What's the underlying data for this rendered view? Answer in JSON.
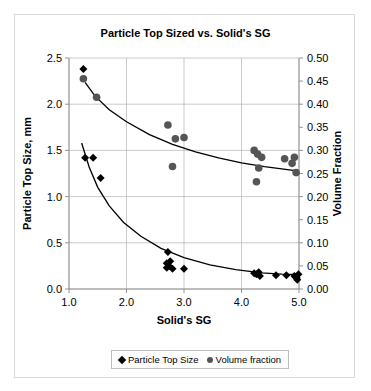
{
  "chart_data": {
    "type": "scatter",
    "title": "Particle Top Sized vs. Solid's SG",
    "xlabel": "Solid's SG",
    "ylabel": "Particle Top Size, mm",
    "y2label": "Volume Fraction",
    "xlim": [
      1.0,
      5.0
    ],
    "ylim": [
      0.0,
      2.5
    ],
    "y2lim": [
      0.0,
      0.5
    ],
    "xticks": [
      "1.0",
      "2.0",
      "3.0",
      "4.0",
      "5.0"
    ],
    "xtick_values": [
      1.0,
      2.0,
      3.0,
      4.0,
      5.0
    ],
    "yticks": [
      "0.0",
      "0.5",
      "1.0",
      "1.5",
      "2.0",
      "2.5"
    ],
    "ytick_values": [
      0.0,
      0.5,
      1.0,
      1.5,
      2.0,
      2.5
    ],
    "y2ticks": [
      "0.00",
      "0.05",
      "0.10",
      "0.15",
      "0.20",
      "0.25",
      "0.30",
      "0.35",
      "0.40",
      "0.45",
      "0.50"
    ],
    "y2tick_values": [
      0.0,
      0.05,
      0.1,
      0.15,
      0.2,
      0.25,
      0.3,
      0.35,
      0.4,
      0.45,
      0.5
    ],
    "grid": true,
    "legend_position": "bottom",
    "colors": {
      "particle_marker": "#000000",
      "volume_marker": "#555555",
      "trend_line": "#000000",
      "grid_line": "#b5b5b5",
      "frame": "#d8d8d8"
    },
    "series": [
      {
        "name": "Particle Top Size",
        "marker": "diamond",
        "color": "#000000",
        "axis": "left",
        "points": [
          [
            1.25,
            2.38
          ],
          [
            1.28,
            1.42
          ],
          [
            1.42,
            1.42
          ],
          [
            1.55,
            1.2
          ],
          [
            2.72,
            0.4
          ],
          [
            2.7,
            0.28
          ],
          [
            2.74,
            0.25
          ],
          [
            2.76,
            0.3
          ],
          [
            2.7,
            0.23
          ],
          [
            2.8,
            0.22
          ],
          [
            3.0,
            0.22
          ],
          [
            4.22,
            0.17
          ],
          [
            4.26,
            0.16
          ],
          [
            4.3,
            0.18
          ],
          [
            4.32,
            0.14
          ],
          [
            4.6,
            0.15
          ],
          [
            4.78,
            0.15
          ],
          [
            4.92,
            0.14
          ],
          [
            4.96,
            0.12
          ],
          [
            4.99,
            0.16
          ],
          [
            4.97,
            0.1
          ]
        ]
      },
      {
        "name": "Volume fraction",
        "marker": "circle",
        "color": "#555555",
        "axis": "right",
        "points": [
          [
            1.25,
            0.455
          ],
          [
            1.48,
            0.415
          ],
          [
            2.72,
            0.355
          ],
          [
            2.85,
            0.325
          ],
          [
            3.0,
            0.328
          ],
          [
            2.8,
            0.265
          ],
          [
            4.22,
            0.3
          ],
          [
            4.28,
            0.292
          ],
          [
            4.35,
            0.285
          ],
          [
            4.3,
            0.262
          ],
          [
            4.26,
            0.232
          ],
          [
            4.75,
            0.282
          ],
          [
            4.92,
            0.285
          ],
          [
            4.88,
            0.272
          ],
          [
            4.95,
            0.252
          ]
        ]
      }
    ],
    "trend_lines": [
      {
        "name": "volume-fraction-trend",
        "axis": "right",
        "points": [
          [
            1.28,
            0.447
          ],
          [
            1.45,
            0.418
          ],
          [
            1.7,
            0.388
          ],
          [
            2.0,
            0.362
          ],
          [
            2.4,
            0.334
          ],
          [
            2.8,
            0.313
          ],
          [
            3.2,
            0.297
          ],
          [
            3.6,
            0.284
          ],
          [
            4.0,
            0.273
          ],
          [
            4.4,
            0.265
          ],
          [
            4.7,
            0.26
          ],
          [
            5.0,
            0.255
          ]
        ]
      },
      {
        "name": "particle-top-size-trend",
        "axis": "left",
        "points": [
          [
            1.22,
            1.58
          ],
          [
            1.35,
            1.32
          ],
          [
            1.5,
            1.1
          ],
          [
            1.7,
            0.9
          ],
          [
            1.95,
            0.72
          ],
          [
            2.25,
            0.57
          ],
          [
            2.6,
            0.44
          ],
          [
            3.0,
            0.34
          ],
          [
            3.45,
            0.26
          ],
          [
            3.9,
            0.21
          ],
          [
            4.35,
            0.175
          ],
          [
            4.7,
            0.16
          ],
          [
            5.0,
            0.155
          ]
        ]
      }
    ],
    "legend": [
      {
        "label": "Particle Top Size",
        "marker": "diamond"
      },
      {
        "label": "Volume fraction",
        "marker": "circle"
      }
    ]
  }
}
